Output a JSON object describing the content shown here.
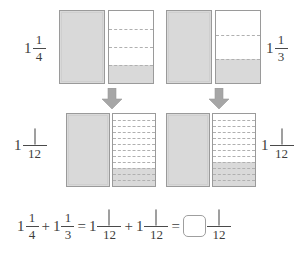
{
  "worksheet": {
    "title": "Adding mixed numbers with unlike denominators using bar models",
    "colors": {
      "shade": "#d9d9d9",
      "outline": "#9a9a9a",
      "dash": "#b0b0b0",
      "arrow": "#a6a6a6",
      "text": "#3d3d3d"
    }
  },
  "row1": {
    "left_label": {
      "whole": "1",
      "numerator": "1",
      "denominator": "4"
    },
    "right_label": {
      "whole": "1",
      "numerator": "1",
      "denominator": "3"
    },
    "models": [
      {
        "name": "one-whole-bar",
        "parts": 1,
        "shaded": 1,
        "dashed": false
      },
      {
        "name": "one-fourth-bar",
        "parts": 4,
        "shaded": 1,
        "dashed": true
      },
      {
        "name": "one-whole-bar",
        "parts": 1,
        "shaded": 1,
        "dashed": false
      },
      {
        "name": "one-third-bar",
        "parts": 3,
        "shaded": 1,
        "dashed": true
      }
    ]
  },
  "arrows": [
    {
      "name": "down-arrow-left",
      "direction": "down"
    },
    {
      "name": "down-arrow-right",
      "direction": "down"
    }
  ],
  "row2": {
    "left_label": {
      "whole": "1",
      "numerator": "",
      "denominator": "12"
    },
    "right_label": {
      "whole": "1",
      "numerator": "",
      "denominator": "12"
    },
    "models": [
      {
        "name": "one-whole-bar",
        "parts": 1,
        "shaded": 1,
        "dashed": false
      },
      {
        "name": "three-twelfths-bar",
        "parts": 12,
        "shaded": 3,
        "dashed": true
      },
      {
        "name": "one-whole-bar",
        "parts": 1,
        "shaded": 1,
        "dashed": false
      },
      {
        "name": "four-twelfths-bar",
        "parts": 12,
        "shaded": 4,
        "dashed": true
      }
    ]
  },
  "equation": {
    "term1": {
      "whole": "1",
      "numerator": "1",
      "denominator": "4"
    },
    "plus1": "+",
    "term2": {
      "whole": "1",
      "numerator": "1",
      "denominator": "3"
    },
    "equals1": "=",
    "term3": {
      "whole": "1",
      "numerator": "",
      "denominator": "12"
    },
    "plus2": "+",
    "term4": {
      "whole": "1",
      "numerator": "",
      "denominator": "12"
    },
    "equals2": "=",
    "answer": {
      "whole": "",
      "numerator": "",
      "denominator": "12"
    }
  }
}
